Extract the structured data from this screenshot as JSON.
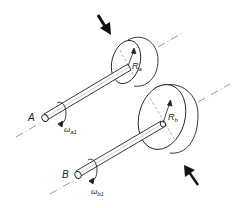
{
  "diagram": {
    "colors": {
      "line": "#222222",
      "axis": "#555555",
      "background": "#ffffff"
    },
    "shaft_a": {
      "label": "A",
      "omega_symbol": "ω",
      "omega_sub": "a1",
      "radius_symbol": "R",
      "radius_sub": "a"
    },
    "shaft_b": {
      "label": "B",
      "omega_symbol": "ω",
      "omega_sub": "b1",
      "radius_symbol": "R",
      "radius_sub": "b"
    },
    "forces": [
      {
        "name": "force-on-disk-a",
        "direction": "down-right"
      },
      {
        "name": "force-on-disk-b",
        "direction": "up-left"
      }
    ]
  }
}
